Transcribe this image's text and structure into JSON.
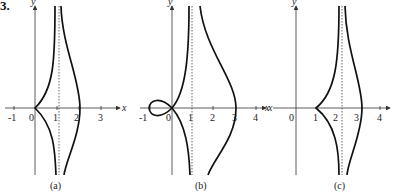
{
  "problem_number": "3.",
  "panels": [
    {
      "caption": "(a)",
      "x_axis_label": "x",
      "y_axis_label": "y",
      "x_ticks": [
        "-1",
        "0",
        "1",
        "2",
        "3"
      ],
      "asymptote": "x ≈ 1.1 (dotted vertical line)",
      "features": "cusp at origin; right branch crosses x-axis near x = 2.1"
    },
    {
      "caption": "(b)",
      "x_axis_label": "x",
      "y_axis_label": "y",
      "x_ticks": [
        "-1",
        "0",
        "1",
        "2",
        "3",
        "4"
      ],
      "asymptote": "x ≈ 1.1 (dotted vertical line)",
      "features": "loop from origin to x = -1; right branch crosses x-axis at x = 3"
    },
    {
      "caption": "(c)",
      "x_axis_label": "x",
      "y_axis_label": "y",
      "x_ticks": [
        "0",
        "1",
        "2",
        "3",
        "4"
      ],
      "asymptote": "x ≈ 2.2 (dotted vertical line)",
      "features": "cusp at x = 1; right branch crosses x-axis near x = 3.1"
    }
  ],
  "colors": {
    "curve": "#111111",
    "axis": "#333333",
    "asymptote": "#555555"
  }
}
